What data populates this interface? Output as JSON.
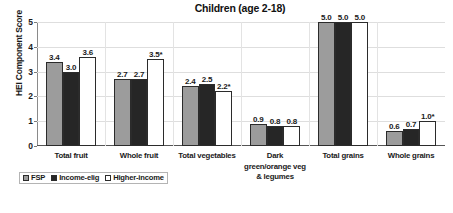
{
  "chart_data": {
    "type": "bar",
    "title": "Children (age 2-18)",
    "xlabel": "",
    "ylabel": "HEI Component Score",
    "ylim": [
      0,
      5
    ],
    "yticks": [
      "0",
      "1",
      "2",
      "3",
      "4",
      "5"
    ],
    "grid": true,
    "legend_position": "bottom-left",
    "categories": [
      "Total fruit",
      "Whole fruit",
      "Total vegetables",
      "Dark green/orange veg & legumes",
      "Total grains",
      "Whole grains"
    ],
    "category_lines": [
      [
        "Total fruit"
      ],
      [
        "Whole fruit"
      ],
      [
        "Total vegetables"
      ],
      [
        "Dark",
        "green/orange veg",
        "& legumes"
      ],
      [
        "Total grains"
      ],
      [
        "Whole grains"
      ]
    ],
    "series": [
      {
        "name": "FSP",
        "color": "#9c9c9c",
        "values": [
          3.4,
          2.7,
          2.4,
          0.9,
          5.0,
          0.6
        ],
        "labels": [
          "3.4",
          "2.7",
          "2.4",
          "0.9",
          "5.0",
          "0.6"
        ]
      },
      {
        "name": "Income-elig",
        "color": "#262626",
        "values": [
          3.0,
          2.7,
          2.5,
          0.8,
          5.0,
          0.7
        ],
        "labels": [
          "3.0",
          "2.7",
          "2.5",
          "0.8",
          "5.0",
          "0.7"
        ]
      },
      {
        "name": "Higher-income",
        "color": "#ffffff",
        "values": [
          3.6,
          3.5,
          2.2,
          0.8,
          5.0,
          1.0
        ],
        "labels": [
          "3.6",
          "3.5*",
          "2.2*",
          "0.8",
          "5.0",
          "1.0*"
        ]
      }
    ],
    "annotation_note": "* denotes statistically significant difference"
  }
}
